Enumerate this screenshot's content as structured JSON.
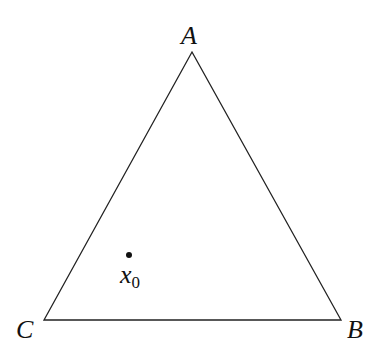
{
  "diagram": {
    "type": "triangle",
    "vertices": [
      {
        "label": "A",
        "x": 192,
        "y": 52
      },
      {
        "label": "B",
        "x": 341,
        "y": 320
      },
      {
        "label": "C",
        "x": 44,
        "y": 320
      }
    ],
    "point": {
      "label": "x",
      "subscript": "0",
      "x": 129,
      "y": 255
    },
    "colors": {
      "stroke": "#222222",
      "text": "#111111"
    }
  }
}
